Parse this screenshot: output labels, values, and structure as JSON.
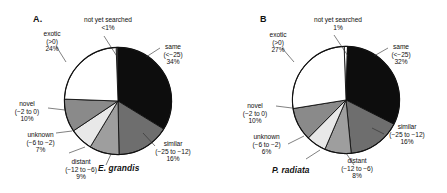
{
  "figure": {
    "panels": [
      {
        "letter": "A.",
        "species": "E. grandis",
        "chart": {
          "type": "pie",
          "title": "E. grandis",
          "start_angle_deg": -2,
          "categories": [
            "not yet searched",
            "same (<−25)",
            "similar (−25 to −12)",
            "distant (−12 to −6)",
            "unknown (−6 to −2)",
            "novel (−2 to 0)",
            "exotic (>0)"
          ],
          "values": [
            0.5,
            34,
            16,
            9,
            7,
            10,
            24
          ],
          "value_labels": [
            "<1%",
            "34%",
            "16%",
            "9%",
            "7%",
            "10%",
            "24%"
          ],
          "colors": [
            "#ffffff",
            "#0d0d0d",
            "#6e6e6e",
            "#9e9e9e",
            "#e8e8e8",
            "#8a8a8a",
            "#ffffff"
          ]
        },
        "labels": [
          {
            "name": "not-yet-searched",
            "line1": "not yet searched",
            "line2": "",
            "line3": "<1%"
          },
          {
            "name": "same",
            "line1": "same",
            "line2": "(<−25)",
            "line3": "34%"
          },
          {
            "name": "similar",
            "line1": "similar",
            "line2": "(−25 to −12)",
            "line3": "16%"
          },
          {
            "name": "distant",
            "line1": "distant",
            "line2": "(−12 to −6)",
            "line3": "9%"
          },
          {
            "name": "unknown",
            "line1": "unknown",
            "line2": "(−6 to −2)",
            "line3": "7%"
          },
          {
            "name": "novel",
            "line1": "novel",
            "line2": "(−2 to 0)",
            "line3": "10%"
          },
          {
            "name": "exotic",
            "line1": "exotic",
            "line2": "(>0)",
            "line3": "24%"
          }
        ]
      },
      {
        "letter": "B",
        "species": "P. radiata",
        "chart": {
          "type": "pie",
          "title": "P. radiata",
          "start_angle_deg": -2,
          "categories": [
            "not yet searched",
            "same (<−25)",
            "similar (−25 to −12)",
            "distant (−12 to −6)",
            "unknown (−6 to −2)",
            "novel (−2 to 0)",
            "exotic (>0)"
          ],
          "values": [
            1,
            32,
            16,
            8,
            6,
            10,
            27
          ],
          "value_labels": [
            "1%",
            "32%",
            "16%",
            "8%",
            "6%",
            "10%",
            "27%"
          ],
          "colors": [
            "#ffffff",
            "#0d0d0d",
            "#6e6e6e",
            "#9e9e9e",
            "#e8e8e8",
            "#8a8a8a",
            "#ffffff"
          ]
        },
        "labels": [
          {
            "name": "not-yet-searched",
            "line1": "not yet searched",
            "line2": "",
            "line3": "1%"
          },
          {
            "name": "same",
            "line1": "same",
            "line2": "(<−25)",
            "line3": "32%"
          },
          {
            "name": "similar",
            "line1": "similar",
            "line2": "(−25 to −12)",
            "line3": "16%"
          },
          {
            "name": "distant",
            "line1": "distant",
            "line2": "(−12 to −6)",
            "line3": "8%"
          },
          {
            "name": "unknown",
            "line1": "unknown",
            "line2": "(−6 to −2)",
            "line3": "6%"
          },
          {
            "name": "novel",
            "line1": "novel",
            "line2": "(−2 to 0)",
            "line3": "10%"
          },
          {
            "name": "exotic",
            "line1": "exotic",
            "line2": "(>0)",
            "line3": "27%"
          }
        ]
      }
    ]
  },
  "chart_data": [
    {
      "type": "pie",
      "title": "E. grandis",
      "panel": "A.",
      "categories": [
        "not yet searched",
        "same (<−25)",
        "similar (−25 to −12)",
        "distant (−12 to −6)",
        "unknown (−6 to −2)",
        "novel (−2 to 0)",
        "exotic (>0)"
      ],
      "values": [
        0.5,
        34,
        16,
        9,
        7,
        10,
        24
      ],
      "value_labels": [
        "<1%",
        "34%",
        "16%",
        "9%",
        "7%",
        "10%",
        "24%"
      ],
      "units": "percent",
      "legend": "none (direct labels with leader lines)",
      "colors": [
        "#ffffff",
        "#0d0d0d",
        "#6e6e6e",
        "#9e9e9e",
        "#e8e8e8",
        "#8a8a8a",
        "#ffffff"
      ]
    },
    {
      "type": "pie",
      "title": "P. radiata",
      "panel": "B",
      "categories": [
        "not yet searched",
        "same (<−25)",
        "similar (−25 to −12)",
        "distant (−12 to −6)",
        "unknown (−6 to −2)",
        "novel (−2 to 0)",
        "exotic (>0)"
      ],
      "values": [
        1,
        32,
        16,
        8,
        6,
        10,
        27
      ],
      "value_labels": [
        "1%",
        "32%",
        "16%",
        "8%",
        "6%",
        "10%",
        "27%"
      ],
      "units": "percent",
      "legend": "none (direct labels with leader lines)",
      "colors": [
        "#ffffff",
        "#0d0d0d",
        "#6e6e6e",
        "#9e9e9e",
        "#e8e8e8",
        "#8a8a8a",
        "#ffffff"
      ]
    }
  ]
}
